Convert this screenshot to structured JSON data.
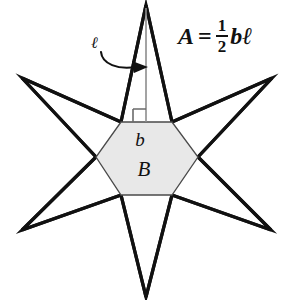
{
  "figure": {
    "background_color": "#ffffff",
    "outline_color": "#111111",
    "hexagon_fill_color": "#e8e8e8",
    "hexagon_stroke_color": "#4a4a4a",
    "altitude_color": "#8c8c8c"
  },
  "labels": {
    "ell": "ℓ",
    "small_b": "b",
    "capital_b": "B"
  },
  "formula": {
    "full": "A = 1/2 bℓ",
    "lhs": "A",
    "equals": "=",
    "numerator": "1",
    "denominator": "2",
    "rhs": "bℓ"
  },
  "geometry": {
    "hexagon_vertices": [
      [
        121,
        122
      ],
      [
        172,
        122
      ],
      [
        198,
        157
      ],
      [
        172,
        195
      ],
      [
        121,
        195
      ],
      [
        96,
        157
      ]
    ],
    "star_points": [
      [
        146,
        5
      ],
      [
        272,
        78
      ],
      [
        271,
        230
      ],
      [
        146,
        297
      ],
      [
        22,
        230
      ],
      [
        22,
        78
      ]
    ],
    "altitude_from": [
      146,
      5
    ],
    "altitude_to": [
      146,
      122
    ],
    "right_angle_marker": [
      133,
      109,
      13,
      13
    ],
    "arrow_start": [
      101,
      55
    ],
    "arrow_tip": [
      144,
      67
    ]
  }
}
